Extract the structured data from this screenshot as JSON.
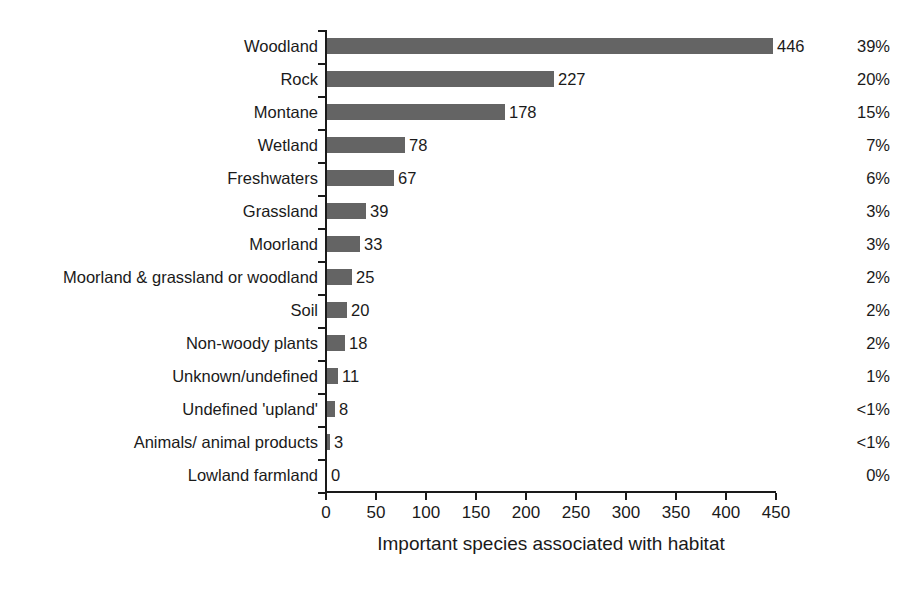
{
  "chart_data": {
    "type": "bar",
    "orientation": "horizontal",
    "title": "",
    "xlabel": "Important species associated with habitat",
    "ylabel": "",
    "xlim": [
      0,
      450
    ],
    "xticks": [
      0,
      50,
      100,
      150,
      200,
      250,
      300,
      350,
      400,
      450
    ],
    "grid": false,
    "legend": false,
    "bar_color": "#646464",
    "axis_color": "#1a1a1a",
    "categories": [
      "Woodland",
      "Rock",
      "Montane",
      "Wetland",
      "Freshwaters",
      "Grassland",
      "Moorland",
      "Moorland & grassland or woodland",
      "Soil",
      "Non-woody plants",
      "Unknown/undefined",
      "Undefined 'upland'",
      "Animals/ animal products",
      "Lowland farmland"
    ],
    "values": [
      446,
      227,
      178,
      78,
      67,
      39,
      33,
      25,
      20,
      18,
      11,
      8,
      3,
      0
    ],
    "value_labels": [
      "446",
      "227",
      "178",
      "78",
      "67",
      "39",
      "33",
      "25",
      "20",
      "18",
      "11",
      "8",
      "3",
      "0"
    ],
    "percent_labels": [
      "39%",
      "20%",
      "15%",
      "7%",
      "6%",
      "3%",
      "3%",
      "2%",
      "2%",
      "2%",
      "1%",
      "<1%",
      "<1%",
      "0%"
    ]
  }
}
